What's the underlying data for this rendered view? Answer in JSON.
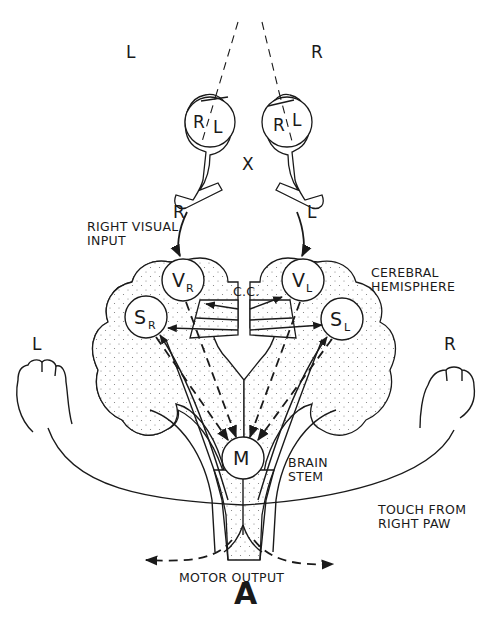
{
  "figure": {
    "panel_label": "A",
    "field_labels": {
      "left": "L",
      "right": "R"
    },
    "chiasm_label": "X",
    "eyes": {
      "left_eye": {
        "retina_left_half": "R",
        "retina_right_half": "L",
        "optic_tract_label": "R"
      },
      "right_eye": {
        "retina_left_half": "R",
        "retina_right_half": "L",
        "optic_tract_label": "L"
      }
    },
    "annotations": {
      "right_visual_input": [
        "RIGHT VISUAL",
        "INPUT"
      ],
      "corpus_callosum": "C.C.",
      "cerebral_hemisphere": [
        "CEREBRAL",
        "HEMISPHERE"
      ],
      "brain_stem": [
        "BRAIN",
        "STEM"
      ],
      "touch_from_right_paw": [
        "TOUCH FROM",
        "RIGHT PAW"
      ],
      "motor_output": "MOTOR OUTPUT"
    },
    "paws": {
      "left": "L",
      "right": "R"
    },
    "nodes": {
      "visual_right": {
        "main": "V",
        "sub": "R"
      },
      "visual_left": {
        "main": "V",
        "sub": "L"
      },
      "somatosensory_right": {
        "main": "S",
        "sub": "R"
      },
      "somatosensory_left": {
        "main": "S",
        "sub": "L"
      },
      "motor": {
        "main": "M"
      }
    },
    "colors": {
      "ink": "#1a1a1a",
      "background": "#ffffff"
    }
  }
}
